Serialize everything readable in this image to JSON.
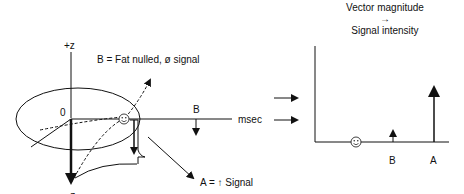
{
  "left_panel": {
    "axis_plus_z": "+z",
    "axis_minus_z": "-z",
    "origin": "0",
    "label_b_desc": "B = Fat nulled, ø signal",
    "label_b": "B",
    "time_axis": "msec",
    "label_a_desc": "A = ↑ Signal",
    "smiley": "☺"
  },
  "right_panel": {
    "title_line1": "Vector magnitude",
    "title_arrow": "→",
    "title_line2": "Signal intensity",
    "label_b": "B",
    "label_a": "A",
    "smiley": "☺",
    "bars": [
      {
        "name": "fat-nulled",
        "label": "",
        "relative_height": 0
      },
      {
        "name": "B",
        "label": "B",
        "relative_height": 0.13
      },
      {
        "name": "A",
        "label": "A",
        "relative_height": 0.62
      }
    ]
  },
  "connector_arrows": 2,
  "colors": {
    "line": "#111111",
    "background": "#ffffff"
  }
}
